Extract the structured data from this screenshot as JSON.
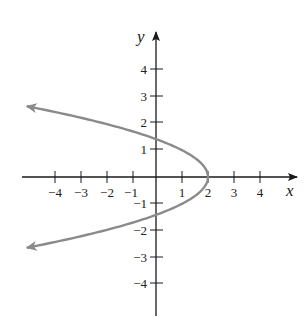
{
  "chart_data": {
    "type": "line",
    "title": "",
    "xlabel": "x",
    "ylabel": "y",
    "xlim": [
      -5,
      5.4
    ],
    "ylim": [
      -5.3,
      5.4
    ],
    "grid": false,
    "x_ticks": [
      -4,
      -3,
      -2,
      -1,
      1,
      2,
      3,
      4
    ],
    "y_ticks": [
      4,
      3,
      2,
      1,
      -1,
      -2,
      -3,
      -4
    ],
    "x_tick_labels": [
      "−4",
      "−3",
      "−2",
      "−1",
      "1",
      "2",
      "3",
      "4"
    ],
    "y_tick_labels": [
      "4",
      "3",
      "2",
      "1",
      "−1",
      "−2",
      "−3",
      "−4"
    ],
    "series": [
      {
        "name": "x = 2 - y^2",
        "equation": "x = 2 - y^2",
        "color": "#8a8a8a",
        "arrows": "both ends",
        "points": [
          {
            "x": -5.0,
            "y": 2.65
          },
          {
            "x": -4.25,
            "y": 2.5
          },
          {
            "x": -2.0,
            "y": 2.0
          },
          {
            "x": 0.0,
            "y": 1.41
          },
          {
            "x": 1.0,
            "y": 1.0
          },
          {
            "x": 2.0,
            "y": 0.0
          },
          {
            "x": 1.0,
            "y": -1.0
          },
          {
            "x": 0.0,
            "y": -1.41
          },
          {
            "x": -2.0,
            "y": -2.0
          },
          {
            "x": -4.25,
            "y": -2.5
          },
          {
            "x": -5.0,
            "y": -2.65
          }
        ]
      }
    ]
  },
  "plot": {
    "origin_px": [
      156,
      177
    ],
    "unit_x_px": 26,
    "unit_y_px": 26.8,
    "axis_color": "#1a1a1a",
    "curve_color": "#8a8a8a"
  }
}
